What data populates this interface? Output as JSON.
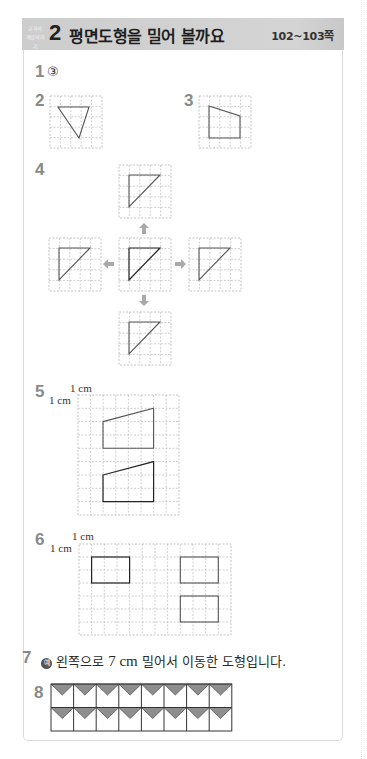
{
  "header": {
    "tag_line1": "교과서",
    "tag_line2": "개념익히기",
    "section_number": "2",
    "title": "평면도형을 밀어 볼까요",
    "pages": "102~103쪽"
  },
  "colors": {
    "header_bg": "#cfcfcf",
    "question_number": "#8a8a8a",
    "grid_line": "#bdbdbd",
    "shape_stroke": "#555555",
    "tile_fill": "#8e8e8e"
  },
  "questions": [
    {
      "number": "1",
      "answer": "③"
    },
    {
      "number": "2",
      "figure": "inverted-triangle-on-grid"
    },
    {
      "number": "3",
      "figure": "quadrilateral-on-grid"
    },
    {
      "number": "4",
      "figure": "right-triangle-slid-up-down-left-right",
      "arrows": [
        "arrow-up",
        "arrow-left",
        "arrow-right",
        "arrow-down"
      ]
    },
    {
      "number": "5",
      "unit_top": "1 cm",
      "unit_left": "1 cm",
      "figure": "two-trapezoids-on-grid"
    },
    {
      "number": "6",
      "unit_top": "1 cm",
      "unit_left": "1 cm",
      "figure": "three-rectangles-on-grid"
    },
    {
      "number": "7",
      "example_mark": "예",
      "text_before": "왼쪽으로 ",
      "value": "7 cm",
      "text_after": " 밀어서 이동한 도형입니다."
    },
    {
      "number": "8",
      "figure": "tile-pattern-2x8"
    }
  ]
}
